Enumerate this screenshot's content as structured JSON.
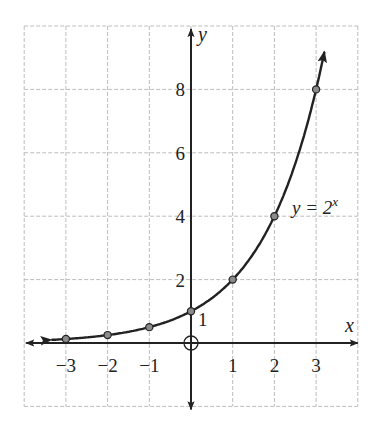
{
  "chart_data": {
    "type": "line",
    "title": "",
    "xlabel": "x",
    "ylabel": "y",
    "xlim": [
      -4,
      4
    ],
    "ylim": [
      -2,
      10
    ],
    "grid": true,
    "x_ticks": [
      -3,
      -2,
      -1,
      1,
      2,
      3
    ],
    "x_tick_labels": [
      "−3",
      "−2",
      "−1",
      "1",
      "2",
      "3"
    ],
    "y_ticks": [
      2,
      4,
      6,
      8
    ],
    "y_tick_labels": [
      "2",
      "4",
      "6",
      "8"
    ],
    "series": [
      {
        "name": "y = 2^x",
        "x": [
          -3,
          -2,
          -1,
          0,
          1,
          2,
          3
        ],
        "y": [
          0.125,
          0.25,
          0.5,
          1,
          2,
          4,
          8
        ]
      }
    ],
    "annotations": [
      {
        "text": "y = 2",
        "superscript": "x",
        "x": 2.5,
        "y": 4.2
      },
      {
        "text": "1",
        "x": 0.2,
        "y": 0.6,
        "note": "y-intercept label"
      },
      {
        "text": "O",
        "x": 0,
        "y": 0,
        "note": "origin marker"
      }
    ]
  },
  "labels": {
    "x_axis": "x",
    "y_axis": "y",
    "equation_main": "y = 2",
    "equation_exp": "x",
    "intercept": "1"
  }
}
